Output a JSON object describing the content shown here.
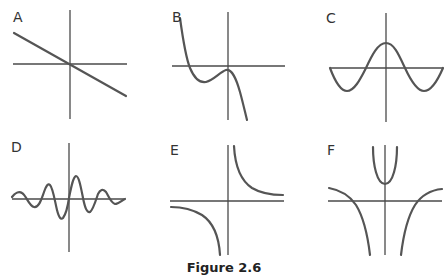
{
  "figure": {
    "caption": "Figure 2.6",
    "panels": [
      {
        "label": "A",
        "shape": "line-decreasing-through-origin"
      },
      {
        "label": "B",
        "shape": "cubic-negative-leading"
      },
      {
        "label": "C",
        "shape": "cosine-wave"
      },
      {
        "label": "D",
        "shape": "damped-oscillation"
      },
      {
        "label": "E",
        "shape": "reciprocal-hyperbola"
      },
      {
        "label": "F",
        "shape": "rational-with-two-vertical-asymptotes"
      }
    ]
  },
  "colors": {
    "axis": "#4a4a4a",
    "curve": "#555555",
    "text": "#333333"
  }
}
